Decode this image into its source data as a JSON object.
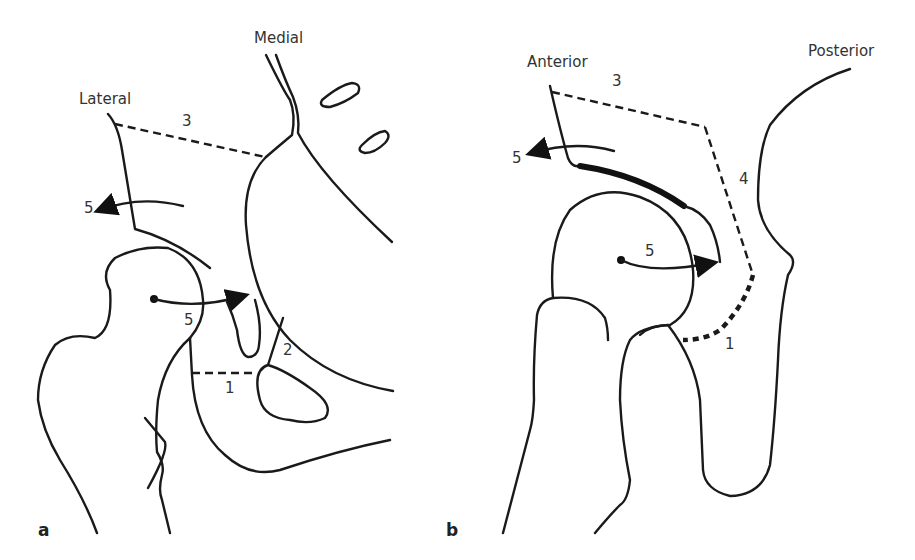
{
  "figure": {
    "panels": [
      {
        "id": "a",
        "label": "a",
        "orientation_labels": {
          "lateral": "Lateral",
          "medial": "Medial"
        },
        "numbers": {
          "n1": "1",
          "n2": "2",
          "n3": "3",
          "n5_upper": "5",
          "n5_lower": "5"
        }
      },
      {
        "id": "b",
        "label": "b",
        "orientation_labels": {
          "anterior": "Anterior",
          "posterior": "Posterior"
        },
        "numbers": {
          "n1": "1",
          "n3": "3",
          "n4": "4",
          "n5_upper": "5",
          "n5_lower": "5"
        }
      }
    ],
    "colors": {
      "line": "#1a1a1a",
      "text": "#333333",
      "background": "#ffffff"
    }
  }
}
